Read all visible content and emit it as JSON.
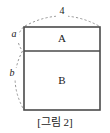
{
  "figure": {
    "caption": "[그림 2]",
    "regions": [
      {
        "id": "A",
        "label": "A"
      },
      {
        "id": "B",
        "label": "B"
      }
    ],
    "dimensions": [
      {
        "id": "top-width",
        "label": "4",
        "orientation": "horizontal",
        "style": "dashed-arc"
      },
      {
        "id": "upper-height",
        "label": "a",
        "orientation": "vertical",
        "style": "dashed-arc"
      },
      {
        "id": "lower-height",
        "label": "b",
        "orientation": "vertical",
        "style": "dashed-arc"
      }
    ],
    "colors": {
      "background": "#ffffff",
      "outline": "#4a4a4a",
      "arc": "#8a8a8a",
      "text": "#1a1a1a"
    }
  }
}
